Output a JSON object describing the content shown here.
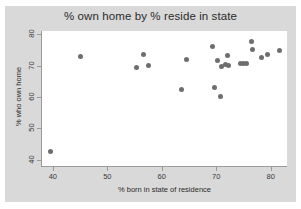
{
  "chart_data": {
    "type": "scatter",
    "title": "% own home by % reside in state",
    "xlabel": "% born in state of residence",
    "ylabel": "% who own home",
    "xlim": [
      38,
      83
    ],
    "ylim": [
      38,
      81
    ],
    "xticks": [
      40,
      50,
      60,
      70,
      80
    ],
    "yticks": [
      40,
      50,
      60,
      70,
      80
    ],
    "grid": false,
    "legend": null,
    "marker_color": "#6e6e72",
    "plot_background": "#ffffff",
    "graph_background": "#d9d9d9",
    "points": [
      {
        "x": 39.5,
        "y": 42.5
      },
      {
        "x": 45.0,
        "y": 72.8
      },
      {
        "x": 55.4,
        "y": 69.3
      },
      {
        "x": 56.6,
        "y": 73.4
      },
      {
        "x": 57.5,
        "y": 69.9
      },
      {
        "x": 63.7,
        "y": 62.4
      },
      {
        "x": 64.5,
        "y": 72.0
      },
      {
        "x": 69.3,
        "y": 76.1
      },
      {
        "x": 69.6,
        "y": 63.0
      },
      {
        "x": 70.2,
        "y": 71.5
      },
      {
        "x": 70.8,
        "y": 60.2
      },
      {
        "x": 71.0,
        "y": 69.8
      },
      {
        "x": 71.7,
        "y": 70.2
      },
      {
        "x": 72.1,
        "y": 73.1
      },
      {
        "x": 72.3,
        "y": 70.1
      },
      {
        "x": 74.5,
        "y": 70.6
      },
      {
        "x": 75.1,
        "y": 70.6
      },
      {
        "x": 75.6,
        "y": 70.8
      },
      {
        "x": 76.4,
        "y": 77.6
      },
      {
        "x": 76.7,
        "y": 75.0
      },
      {
        "x": 78.3,
        "y": 72.6
      },
      {
        "x": 79.5,
        "y": 73.6
      },
      {
        "x": 81.6,
        "y": 74.8
      }
    ]
  }
}
